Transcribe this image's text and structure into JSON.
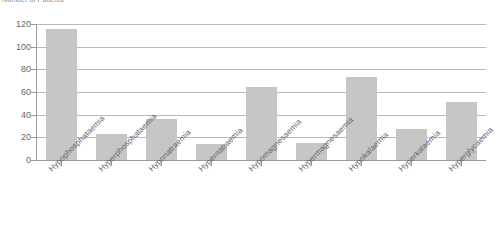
{
  "chart_data": {
    "type": "bar",
    "title": "Number of Patients",
    "xlabel": "",
    "ylabel": "Number of Patients",
    "ylim": [
      0,
      120
    ],
    "ytick_step": 20,
    "yticks": [
      0,
      20,
      40,
      60,
      80,
      100,
      120
    ],
    "grid": true,
    "legend": false,
    "bar_color": "#c6c6c6",
    "axis_color": "#9a9a9a",
    "grid_color": "#b9b9b9",
    "categories": [
      "Hypophosphataemia",
      "Hyperphosphataemia",
      "Hyponatraemia",
      "Hypernatraemia",
      "Hypomagnesaemia",
      "Hypermagnesaemia",
      "Hypokalaemia",
      "Hyperkalaemia",
      "Hyperglycaemia"
    ],
    "values": [
      116,
      23,
      36,
      14,
      64,
      15,
      73,
      27,
      51
    ]
  }
}
